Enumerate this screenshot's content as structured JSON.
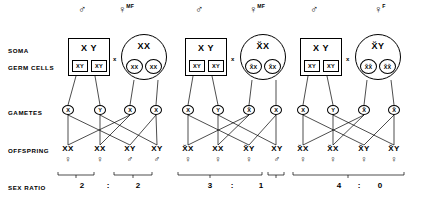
{
  "figure": {
    "type": "genetics-cross-diagram",
    "row_labels": [
      "SOMA",
      "GERM CELLS",
      "GAMETES",
      "OFFSPRING",
      "SEX RATIO"
    ],
    "cross_symbol": "x",
    "ratio_separator": ":"
  },
  "panels": [
    {
      "id": "panel-1",
      "father": {
        "sex_symbol": "♂",
        "tag": "",
        "soma_genotype": "X Y",
        "germ_cells": [
          "XY",
          "XY"
        ],
        "shape": "box"
      },
      "mother": {
        "sex_symbol": "♀",
        "tag": "MF",
        "soma_genotype": "XX",
        "germ_cells": [
          "XX",
          "XX"
        ],
        "shape": "circle"
      },
      "gametes": [
        "X",
        "Y",
        "X",
        "X"
      ],
      "offspring": [
        {
          "genotype": "XX",
          "sex": "♀"
        },
        {
          "genotype": "XX",
          "sex": "♀"
        },
        {
          "genotype": "XY",
          "sex": "♂"
        },
        {
          "genotype": "XY",
          "sex": "♂"
        }
      ],
      "sex_ratio": {
        "female": "2",
        "male": "2",
        "text": "2 : 2"
      }
    },
    {
      "id": "panel-2",
      "father": {
        "sex_symbol": "♂",
        "tag": "",
        "soma_genotype": "X Y",
        "germ_cells": [
          "XY",
          "XY"
        ],
        "shape": "box"
      },
      "mother": {
        "sex_symbol": "♀",
        "tag": "MF",
        "soma_genotype": "X̆X",
        "germ_cells": [
          "X̆X",
          "X̆X"
        ],
        "shape": "circle"
      },
      "gametes": [
        "X",
        "Y",
        "X̆",
        "X"
      ],
      "offspring": [
        {
          "genotype": "X̆X",
          "sex": "♀"
        },
        {
          "genotype": "XX",
          "sex": "♀"
        },
        {
          "genotype": "X̆Y",
          "sex": "♀"
        },
        {
          "genotype": "XY",
          "sex": "♂"
        }
      ],
      "sex_ratio": {
        "female": "3",
        "male": "1",
        "text": "3 : 1"
      }
    },
    {
      "id": "panel-3",
      "father": {
        "sex_symbol": "♂",
        "tag": "",
        "soma_genotype": "X Y",
        "germ_cells": [
          "XY",
          "XY"
        ],
        "shape": "box"
      },
      "mother": {
        "sex_symbol": "♀",
        "tag": "F",
        "soma_genotype": "X̆Y",
        "germ_cells": [
          "X̆X̆",
          "X̆X̆"
        ],
        "shape": "circle"
      },
      "gametes": [
        "X",
        "Y",
        "X̆",
        "X̆"
      ],
      "offspring": [
        {
          "genotype": "X̆X",
          "sex": "♀"
        },
        {
          "genotype": "X̆X",
          "sex": "♀"
        },
        {
          "genotype": "X̆Y",
          "sex": "♀"
        },
        {
          "genotype": "X̆Y",
          "sex": "♀"
        }
      ],
      "sex_ratio": {
        "female": "4",
        "male": "0",
        "text": "4 : 0"
      }
    }
  ]
}
